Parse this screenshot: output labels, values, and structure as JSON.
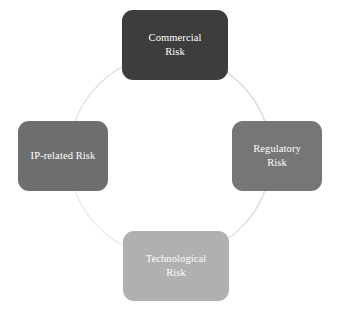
{
  "diagram": {
    "type": "cycle",
    "title": "",
    "background_color": "#ffffff",
    "ring": {
      "name": "cycle-ring",
      "stroke_color": "#d8d8d8",
      "stroke_width": 1,
      "center_x": 170,
      "center_y": 156,
      "radius": 101,
      "style": "solid-faint"
    },
    "nodes": [
      {
        "id": "commercial",
        "label": "Commercial\nRisk",
        "position": "top",
        "fill_color": "#3d3d3d",
        "text_color": "#ffffff"
      },
      {
        "id": "regulatory",
        "label": "Regulatory\nRisk",
        "position": "right",
        "fill_color": "#767676",
        "text_color": "#ffffff"
      },
      {
        "id": "technological",
        "label": "Technological\nRisk",
        "position": "bottom",
        "fill_color": "#b0b0b0",
        "text_color": "#ffffff"
      },
      {
        "id": "iprelated",
        "label": "IP-related Risk",
        "position": "left",
        "fill_color": "#6e6e6e",
        "text_color": "#ffffff"
      }
    ]
  }
}
